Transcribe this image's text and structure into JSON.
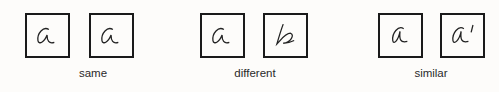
{
  "groups": [
    {
      "label": "same",
      "glyphs": [
        "a",
        "a"
      ]
    },
    {
      "label": "different",
      "glyphs": [
        "a",
        "b"
      ]
    },
    {
      "label": "similar",
      "glyphs": [
        "a",
        "a′"
      ]
    }
  ]
}
